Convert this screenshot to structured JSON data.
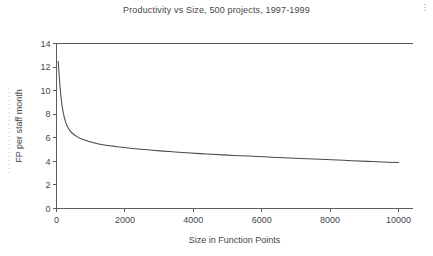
{
  "chart_data": {
    "type": "line",
    "title": "Productivity vs Size, 500 projects, 1997-1999",
    "xlabel": "Size in Function Points",
    "ylabel": "FP per staff month",
    "xlim": [
      0,
      10000
    ],
    "ylim": [
      0,
      14
    ],
    "xticks": [
      0,
      2000,
      4000,
      6000,
      8000,
      10000
    ],
    "xticklabels": [
      "0",
      "2000",
      "4000",
      "6000",
      "8000",
      "10000"
    ],
    "yticks": [
      0,
      2,
      4,
      6,
      8,
      10,
      12,
      14
    ],
    "yticklabels": [
      "0",
      "2",
      "4",
      "6",
      "8",
      "10",
      "12",
      "14"
    ],
    "grid": false,
    "legend": null,
    "legend_position": "none",
    "annotations": [],
    "series": [
      {
        "name": "FP per staff month",
        "x": [
          50,
          80,
          110,
          150,
          200,
          260,
          330,
          410,
          500,
          600,
          720,
          860,
          1000,
          1200,
          1450,
          1700,
          2000,
          2400,
          2800,
          3300,
          3800,
          4400,
          5000,
          5600,
          6300,
          7000,
          7700,
          8400,
          9100,
          9700,
          10000
        ],
        "y": [
          12.5,
          11.2,
          10.1,
          9.0,
          8.1,
          7.4,
          6.9,
          6.55,
          6.3,
          6.1,
          5.92,
          5.78,
          5.65,
          5.5,
          5.37,
          5.27,
          5.17,
          5.04,
          4.94,
          4.83,
          4.73,
          4.62,
          4.53,
          4.45,
          4.35,
          4.26,
          4.17,
          4.09,
          4.0,
          3.93,
          3.9
        ]
      }
    ]
  },
  "figure": {
    "background_color": "#ffffff",
    "line_color": "#4a4a4e",
    "axis_color": "#5c5c60",
    "text_color": "#46464a"
  }
}
